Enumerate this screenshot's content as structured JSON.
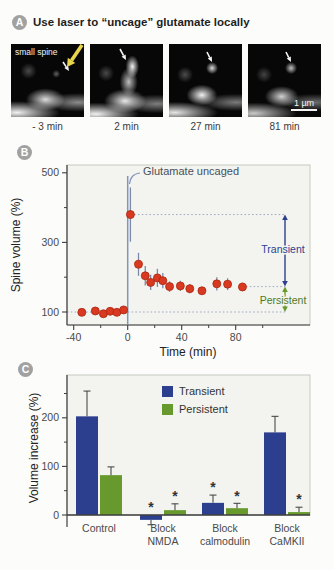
{
  "colors": {
    "red": "#d93920",
    "red_stroke": "#a92610",
    "navy": "#2c3f8f",
    "green": "#67992c",
    "green_text": "#4e7a1e",
    "dotted": "#9fabc4",
    "uncage_line": "#8095bd",
    "err_b": "#7a8aa8",
    "axis": "#3f3f3f",
    "tick_text": "#4a4a4a",
    "label_text": "#222222",
    "plot_bg": "#f3f4ef",
    "frame_border": "#c5c9bf",
    "err_c": "#4a4a4a",
    "star": "#333333",
    "annotation_text": "#474f5e",
    "yellow_arrow": "#e8d44d",
    "white_arrow": "#f5f5f5"
  },
  "panel_a": {
    "badge": "A",
    "title": "Use laser to “uncage” glutamate locally",
    "spine_annotation": "small spine",
    "scale_bar_label": "1 µm",
    "frames": [
      {
        "time_label": "- 3 min"
      },
      {
        "time_label": "2 min"
      },
      {
        "time_label": "27 min"
      },
      {
        "time_label": "81 min"
      }
    ],
    "white_arrows": [
      {
        "x1": 52,
        "y1": 18,
        "x2": 58,
        "y2": 27
      },
      {
        "x1": 30,
        "y1": 5,
        "x2": 36,
        "y2": 16
      },
      {
        "x1": 38,
        "y1": 8,
        "x2": 43,
        "y2": 18
      },
      {
        "x1": 38,
        "y1": 8,
        "x2": 43,
        "y2": 18
      }
    ],
    "yellow_arrow": {
      "x1": 71,
      "y1": 1,
      "x2": 56,
      "y2": 23
    }
  },
  "panel_b": {
    "badge": "B"
  },
  "panel_c": {
    "badge": "C"
  },
  "chart_data": [
    {
      "id": "spine-volume-timecourse",
      "type": "scatter",
      "title": "",
      "xlabel": "Time (min)",
      "ylabel": "Spine volume (%)",
      "xlim": [
        -45,
        135
      ],
      "ylim": [
        60,
        520
      ],
      "xticks": [
        -40,
        0,
        40,
        80
      ],
      "xminorticks": [
        -20,
        20,
        60,
        100
      ],
      "yticks": [
        100,
        300,
        500
      ],
      "yminorticks": [
        200,
        400
      ],
      "grid": false,
      "x": [
        -34,
        -24,
        -18,
        -13,
        -8,
        -3,
        2,
        8,
        13,
        17,
        22,
        26,
        31,
        39,
        46,
        55,
        66,
        74,
        85
      ],
      "y": [
        99,
        103,
        95,
        102,
        99,
        106,
        380,
        237,
        204,
        185,
        198,
        190,
        173,
        175,
        167,
        161,
        181,
        180,
        172
      ],
      "yerr": [
        0,
        0,
        0,
        0,
        0,
        0,
        78,
        33,
        28,
        22,
        26,
        22,
        15,
        15,
        13,
        10,
        19,
        17,
        12
      ],
      "annotation": "Glutamate uncaged",
      "uncage_time": 0,
      "reference_levels": {
        "peak": 380,
        "persistent": 173,
        "baseline": 100
      },
      "range_labels": {
        "transient": "Transient",
        "persistent": "Persistent"
      }
    },
    {
      "id": "volume-increase-bars",
      "type": "bar",
      "title": "",
      "xlabel": "",
      "ylabel": "Volume increase (%)",
      "ylim": [
        -30,
        288
      ],
      "yticks": [
        0,
        100,
        200
      ],
      "yminorticks": [
        50,
        150,
        250
      ],
      "grid": false,
      "legend_position": "top-center",
      "categories": [
        "Control",
        "Block\nNMDA",
        "Block\ncalmodulin",
        "Block\nCaMKII"
      ],
      "series": [
        {
          "name": "Transient",
          "color_key": "navy",
          "values": [
            203,
            -10,
            25,
            170
          ],
          "errors": [
            52,
            10,
            16,
            33
          ],
          "significant": [
            false,
            true,
            true,
            false
          ]
        },
        {
          "name": "Persistent",
          "color_key": "green",
          "values": [
            82,
            10,
            14,
            6
          ],
          "errors": [
            17,
            13,
            10,
            10
          ],
          "significant": [
            false,
            true,
            true,
            true
          ]
        }
      ],
      "star_symbol": "*"
    }
  ]
}
